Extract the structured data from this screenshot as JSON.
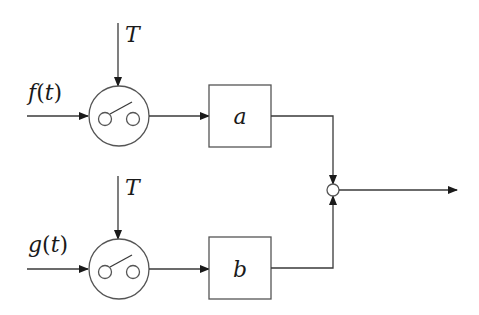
{
  "diagram": {
    "type": "block-diagram",
    "colors": {
      "line": "#3a3a3a",
      "node_border": "#555555",
      "background": "#ffffff",
      "text": "#1a1a1a"
    },
    "inputs": [
      {
        "id": "f",
        "name": "f",
        "arg": "t",
        "paren_open": "(",
        "paren_close": ")"
      },
      {
        "id": "g",
        "name": "g",
        "arg": "t",
        "paren_open": "(",
        "paren_close": ")"
      }
    ],
    "samplers": [
      {
        "id": "sampler-top",
        "period_label": "T",
        "icon": "sampler-switch-icon"
      },
      {
        "id": "sampler-bottom",
        "period_label": "T",
        "icon": "sampler-switch-icon"
      }
    ],
    "blocks": [
      {
        "id": "block-a",
        "label": "a"
      },
      {
        "id": "block-b",
        "label": "b"
      }
    ],
    "junction": {
      "id": "summing-junction",
      "icon": "summing-junction-icon"
    },
    "output": {
      "id": "output",
      "icon": "arrow-right-icon"
    }
  }
}
